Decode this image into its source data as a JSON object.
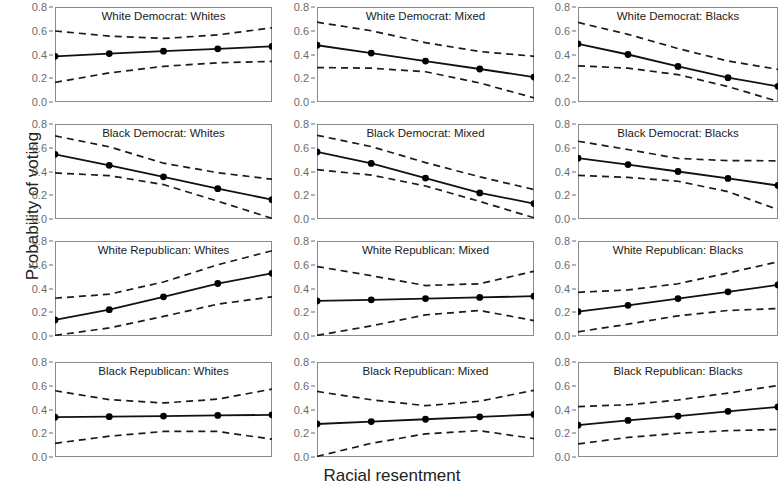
{
  "chart_data": {
    "type": "line",
    "title": "",
    "xlabel": "Racial resentment",
    "ylabel": "Probability of voting",
    "xlim": [
      0,
      1
    ],
    "ylim": [
      0.0,
      0.8
    ],
    "yticks": [
      0.0,
      0.2,
      0.4,
      0.6,
      0.8
    ],
    "ytick_labels": [
      "0.0",
      "0.2",
      "0.4",
      "0.6",
      "0.8"
    ],
    "xticks": [],
    "xtick_labels": [],
    "grid": false,
    "legend": "none",
    "layout": {
      "rows": 4,
      "cols": 3
    },
    "x": [
      0.0,
      0.25,
      0.5,
      0.75,
      1.0
    ],
    "series_style": {
      "estimate": "solid line with filled circle markers",
      "interval": "dashed lines (upper and lower confidence bounds)"
    },
    "panels": [
      {
        "title": "White Democrat: Whites",
        "row": 1,
        "col": 1,
        "estimate": [
          0.385,
          0.408,
          0.428,
          0.448,
          0.468
        ],
        "lower": [
          0.165,
          0.245,
          0.3,
          0.33,
          0.342
        ],
        "upper": [
          0.598,
          0.555,
          0.535,
          0.565,
          0.625
        ]
      },
      {
        "title": "White Democrat: Mixed",
        "row": 1,
        "col": 2,
        "estimate": [
          0.478,
          0.412,
          0.345,
          0.278,
          0.21
        ],
        "lower": [
          0.29,
          0.285,
          0.255,
          0.16,
          0.035
        ],
        "upper": [
          0.672,
          0.6,
          0.5,
          0.425,
          0.385
        ]
      },
      {
        "title": "White Democrat: Blacks",
        "row": 1,
        "col": 3,
        "estimate": [
          0.49,
          0.4,
          0.3,
          0.205,
          0.132
        ],
        "lower": [
          0.305,
          0.285,
          0.23,
          0.13,
          0.005
        ],
        "upper": [
          0.67,
          0.57,
          0.45,
          0.345,
          0.275
        ]
      },
      {
        "title": "Black Democrat: Whites",
        "row": 2,
        "col": 1,
        "estimate": [
          0.545,
          0.452,
          0.355,
          0.255,
          0.163
        ],
        "lower": [
          0.388,
          0.365,
          0.29,
          0.15,
          0.005
        ],
        "upper": [
          0.7,
          0.608,
          0.47,
          0.39,
          0.335
        ]
      },
      {
        "title": "Black Democrat: Mixed",
        "row": 2,
        "col": 2,
        "estimate": [
          0.565,
          0.468,
          0.345,
          0.22,
          0.13
        ],
        "lower": [
          0.415,
          0.37,
          0.278,
          0.148,
          0.01
        ],
        "upper": [
          0.705,
          0.61,
          0.475,
          0.355,
          0.248
        ]
      },
      {
        "title": "Black Democrat: Blacks",
        "row": 2,
        "col": 3,
        "estimate": [
          0.512,
          0.458,
          0.4,
          0.342,
          0.282
        ],
        "lower": [
          0.368,
          0.35,
          0.318,
          0.23,
          0.08
        ],
        "upper": [
          0.655,
          0.585,
          0.51,
          0.492,
          0.49
        ]
      },
      {
        "title": "White Republican: Whites",
        "row": 3,
        "col": 1,
        "estimate": [
          0.135,
          0.222,
          0.33,
          0.442,
          0.528
        ],
        "lower": [
          0.005,
          0.068,
          0.165,
          0.268,
          0.33
        ],
        "upper": [
          0.318,
          0.352,
          0.455,
          0.6,
          0.718
        ]
      },
      {
        "title": "White Republican: Mixed",
        "row": 3,
        "col": 2,
        "estimate": [
          0.295,
          0.305,
          0.315,
          0.325,
          0.335
        ],
        "lower": [
          0.005,
          0.085,
          0.178,
          0.215,
          0.13
        ],
        "upper": [
          0.585,
          0.508,
          0.425,
          0.44,
          0.545
        ]
      },
      {
        "title": "White Republican: Blacks",
        "row": 3,
        "col": 3,
        "estimate": [
          0.205,
          0.258,
          0.315,
          0.372,
          0.43
        ],
        "lower": [
          0.035,
          0.1,
          0.17,
          0.215,
          0.232
        ],
        "upper": [
          0.368,
          0.388,
          0.44,
          0.53,
          0.625
        ]
      },
      {
        "title": "Black Republican: Whites",
        "row": 4,
        "col": 1,
        "estimate": [
          0.335,
          0.34,
          0.345,
          0.35,
          0.355
        ],
        "lower": [
          0.115,
          0.175,
          0.215,
          0.215,
          0.15
        ],
        "upper": [
          0.558,
          0.483,
          0.455,
          0.487,
          0.572
        ]
      },
      {
        "title": "Black Republican: Mixed",
        "row": 4,
        "col": 2,
        "estimate": [
          0.278,
          0.298,
          0.318,
          0.338,
          0.358
        ],
        "lower": [
          0.005,
          0.115,
          0.195,
          0.222,
          0.155
        ],
        "upper": [
          0.552,
          0.482,
          0.432,
          0.47,
          0.562
        ]
      },
      {
        "title": "Black Republican: Blacks",
        "row": 4,
        "col": 3,
        "estimate": [
          0.268,
          0.308,
          0.345,
          0.385,
          0.422
        ],
        "lower": [
          0.11,
          0.165,
          0.2,
          0.222,
          0.232
        ],
        "upper": [
          0.425,
          0.44,
          0.48,
          0.538,
          0.602
        ]
      }
    ]
  },
  "style": {
    "line_color": "#111111",
    "interval_color": "#1a1a1a",
    "marker_color": "#000000",
    "frame_color": "#8a8a8a",
    "tick_label_color": "#6b6b6b",
    "background": "#ffffff"
  }
}
